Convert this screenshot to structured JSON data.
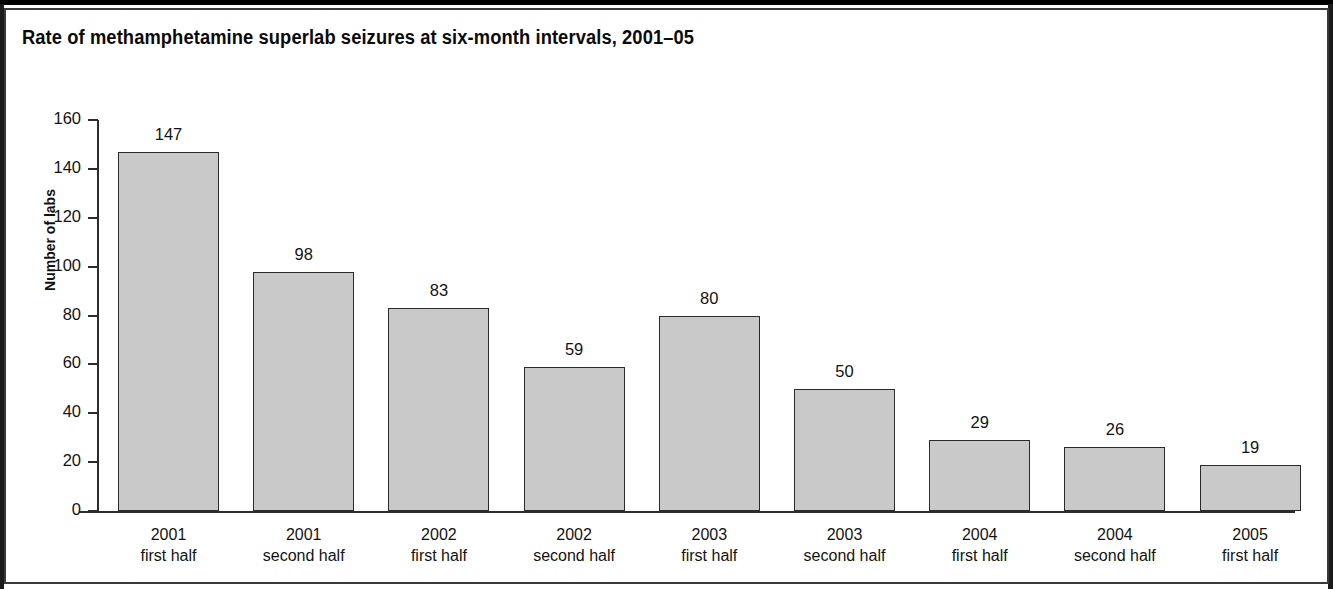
{
  "figure": {
    "title": "Rate of methamphetamine superlab seizures at six-month intervals, 2001–05",
    "background_color": "#ffffff",
    "border_color": "#1b1b1b"
  },
  "chart_data": {
    "type": "bar",
    "title": "Rate of methamphetamine superlab seizures at six-month intervals, 2001–05",
    "xlabel": "",
    "ylabel": "Number of labs",
    "ylim": [
      0,
      160
    ],
    "ytick_labels": [
      "160",
      "140",
      "120",
      "100",
      "80",
      "60",
      "40",
      "20",
      "0"
    ],
    "yticks": [
      160,
      140,
      120,
      100,
      80,
      60,
      40,
      20,
      0
    ],
    "grid": false,
    "legend": false,
    "bar_color": "#c9c9c9",
    "bar_edge_color": "#2b2b2b",
    "categories": [
      {
        "year": "2001",
        "period": "first half"
      },
      {
        "year": "2001",
        "period": "second half"
      },
      {
        "year": "2002",
        "period": "first half"
      },
      {
        "year": "2002",
        "period": "second half"
      },
      {
        "year": "2003",
        "period": "first half"
      },
      {
        "year": "2003",
        "period": "second half"
      },
      {
        "year": "2004",
        "period": "first half"
      },
      {
        "year": "2004",
        "period": "second half"
      },
      {
        "year": "2005",
        "period": "first half"
      }
    ],
    "values": [
      147,
      98,
      83,
      59,
      80,
      50,
      29,
      26,
      19
    ],
    "value_labels": [
      "147",
      "98",
      "83",
      "59",
      "80",
      "50",
      "29",
      "26",
      "19"
    ]
  }
}
